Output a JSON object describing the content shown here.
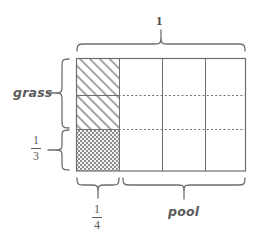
{
  "figure": {
    "title_label": "1",
    "labels": {
      "top_total": "1",
      "left_grass": "grass",
      "left_fraction_numerator": "1",
      "left_fraction_denominator": "3",
      "bottom_fraction_numerator": "1",
      "bottom_fraction_denominator": "4",
      "bottom_pool": "pool"
    },
    "colors": {
      "line": "#6e6e6e",
      "text": "#5b5b5b",
      "hatch": "#9a9a9a",
      "background": "#ffffff"
    },
    "geometry": {
      "rect_left": 76,
      "rect_top": 58,
      "rect_right": 246,
      "rect_bottom": 171,
      "columns": 4,
      "rows": 3,
      "column_dividers": [
        119,
        162,
        205
      ],
      "row_dividers": [
        95,
        129
      ]
    },
    "regions": {
      "grass_top_pattern": "diagonal-hatch",
      "grass_bottom_pattern": "checker-hatch",
      "pool_pattern": "empty"
    }
  }
}
